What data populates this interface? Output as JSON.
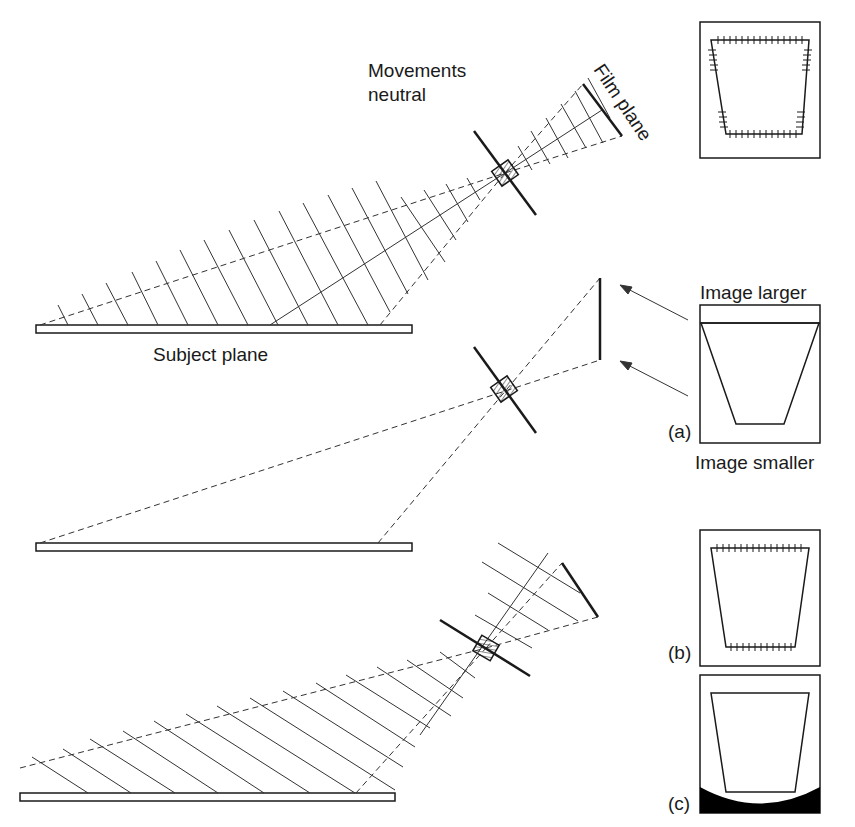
{
  "labels": {
    "movements_line1": "Movements",
    "movements_line2": "neutral",
    "film_plane": "Film plane",
    "subject_plane": "Subject plane",
    "image_larger": "Image larger",
    "image_smaller": "Image smaller",
    "panel_a": "(a)",
    "panel_b": "(b)",
    "panel_c": "(c)"
  },
  "sections": [
    {
      "id": "top",
      "description": "Movements neutral: lens and film plane parallel, subject plane receding",
      "grid": "hatched fan with cross-lines"
    },
    {
      "id": "middle",
      "description": "Film plane vertical, rays to subject plane ends",
      "inset": "(a) keystoned trapezoid, image larger at top, smaller at bottom"
    },
    {
      "id": "bottom",
      "description": "Film plane tilted (Scheimpflug) bringing subject plane into focus",
      "insets": [
        "(b) trapezoid with sharp edges",
        "(c) trapezoid with vignetted dark bottom"
      ]
    }
  ],
  "colors": {
    "line": "#1a1a1a",
    "background": "#ffffff",
    "vignette": "#000000"
  }
}
